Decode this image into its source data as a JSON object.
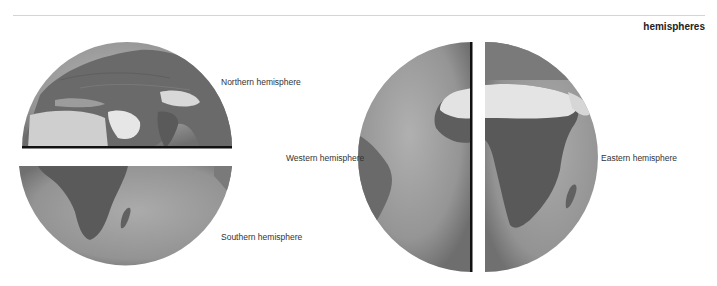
{
  "header": {
    "title": "hemispheres"
  },
  "figure": {
    "labels": {
      "northern": "Northern hemisphere",
      "southern": "Southern hemisphere",
      "western": "Western hemisphere",
      "eastern": "Eastern hemisphere"
    },
    "panels": [
      {
        "id": "northern",
        "description": "Upper half of globe showing Europe, Asia, North Africa, Arabia, India"
      },
      {
        "id": "southern",
        "description": "Lower half of globe showing southern Africa, Madagascar, Indian Ocean"
      },
      {
        "id": "western",
        "description": "Left half of globe showing South America and western Africa"
      },
      {
        "id": "eastern",
        "description": "Right half of globe showing Africa and Madagascar"
      }
    ],
    "colors": {
      "ocean": "#9a9a9a",
      "land": "#5e5e5e",
      "desert": "#e2e2e2",
      "cut_edge": "#111111",
      "rule": "#d4d4d4"
    }
  }
}
